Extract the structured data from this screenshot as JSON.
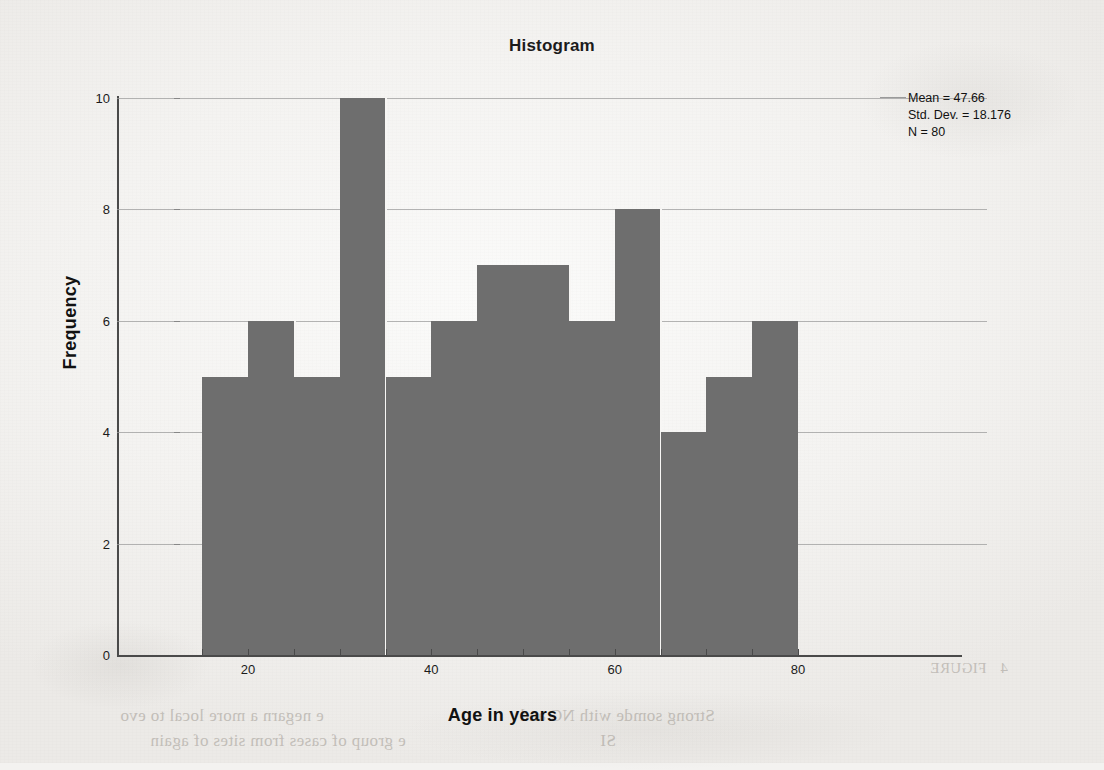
{
  "chart_data": {
    "type": "bar",
    "title": "Histogram",
    "xlabel": "Age in years",
    "ylabel": "Frequency",
    "categories": [
      "15-20",
      "20-25",
      "25-30",
      "30-35",
      "35-40",
      "40-45",
      "45-50",
      "50-55",
      "55-60",
      "60-65",
      "65-70",
      "70-75",
      "75-80"
    ],
    "bin_starts": [
      15,
      20,
      25,
      30,
      35,
      40,
      45,
      50,
      55,
      60,
      65,
      70,
      75
    ],
    "bin_width": 5,
    "values": [
      5,
      6,
      5,
      10,
      5,
      6,
      7,
      7,
      6,
      8,
      4,
      5,
      6
    ],
    "xlim": [
      12,
      92
    ],
    "ylim": [
      0,
      10
    ],
    "xticks": [
      20,
      40,
      60,
      80
    ],
    "xtick_labels": [
      "20",
      "40",
      "60",
      "80"
    ],
    "yticks": [
      0,
      2,
      4,
      6,
      8,
      10
    ],
    "ytick_labels": [
      "0",
      "2",
      "4",
      "6",
      "8",
      "10"
    ],
    "grid": true,
    "legend": "none",
    "bar_color": "#6e6e6e",
    "annotations": {
      "mean": "Mean = 47.66",
      "std_dev": "Std. Dev. = 18.176",
      "n": "N = 80"
    }
  },
  "ghost_text": [
    {
      "text": "e negarn a more local to evo",
      "x": 120,
      "y": 706,
      "size": 17
    },
    {
      "text": "Strong somde with NC and",
      "x": 520,
      "y": 706,
      "size": 17
    },
    {
      "text": "e group of cases from sites of again",
      "x": 150,
      "y": 731,
      "size": 17
    },
    {
      "text": "SI",
      "x": 600,
      "y": 731,
      "size": 17
    },
    {
      "text": "FIGURE",
      "x": 930,
      "y": 660,
      "size": 15
    },
    {
      "text": "4",
      "x": 1000,
      "y": 660,
      "size": 15
    }
  ]
}
